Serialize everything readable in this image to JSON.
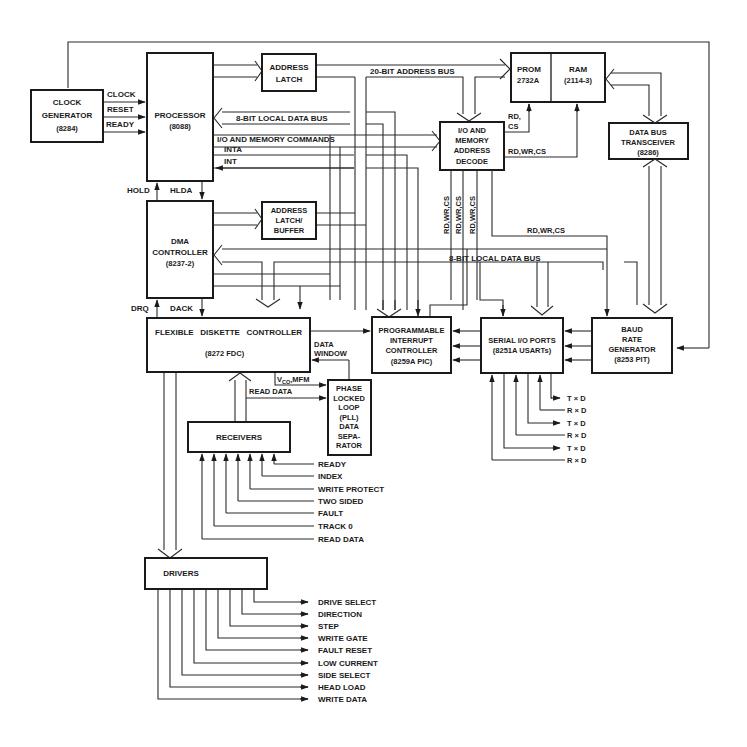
{
  "blocks": {
    "clock_generator": {
      "line1": "CLOCK",
      "line2": "GENERATOR",
      "line3": "(8284)"
    },
    "processor": {
      "line1": "PROCESSOR",
      "line2": "(8088)"
    },
    "address_latch": {
      "line1": "ADDRESS",
      "line2": "LATCH"
    },
    "prom": {
      "line1": "PROM",
      "line2": "2732A"
    },
    "ram": {
      "line1": "RAM",
      "line2": "(2114-3)"
    },
    "io_decode": {
      "line1": "I/O AND",
      "line2": "MEMORY",
      "line3": "ADDRESS",
      "line4": "DECODE"
    },
    "data_bus_transceiver": {
      "line1": "DATA BUS",
      "line2": "TRANSCEIVER",
      "line3": "(8286)"
    },
    "dma_controller": {
      "line1": "DMA",
      "line2": "CONTROLLER",
      "line3": "(8237-2)"
    },
    "address_latch_buffer": {
      "line1": "ADDRESS",
      "line2": "LATCH/",
      "line3": "BUFFER"
    },
    "fdc": {
      "line1": "FLEXIBLE   DISKETTE   CONTROLLER",
      "line2": "(8272 FDC)"
    },
    "pic": {
      "line1": "PROGRAMMABLE",
      "line2": "INTERRUPT",
      "line3": "CONTROLLER",
      "line4": "(8259A PIC)"
    },
    "serial_io": {
      "line1": "SERIAL I/O PORTS",
      "line2": "(8251A USARTs)"
    },
    "baud_rate": {
      "line1": "BAUD",
      "line2": "RATE",
      "line3": "GENERATOR",
      "line4": "(8253 PIT)"
    },
    "pll": {
      "line1": "PHASE",
      "line2": "LOCKED",
      "line3": "LOOP",
      "line4": "(PLL)",
      "line5": "DATA",
      "line6": "SEPA-",
      "line7": "RATOR"
    },
    "receivers": {
      "label": "RECEIVERS"
    },
    "drivers": {
      "label": "DRIVERS"
    }
  },
  "signals": {
    "clock": "CLOCK",
    "reset": "RESET",
    "ready": "READY",
    "hold": "HOLD",
    "hlda": "HLDA",
    "drq": "DRQ",
    "dack": "DACK",
    "address_bus_20": "20-BIT ADDRESS BUS",
    "local_data_bus_top": "8-BIT LOCAL DATA BUS",
    "local_data_bus_mid": "8-BIT  LOCAL  DATA  BUS",
    "io_mem_commands": "I/O AND MEMORY COMMANDS",
    "inta": "INTA",
    "int": "INT",
    "rd_cs_1": "RD,",
    "rd_cs_2": "CS",
    "rd_wr_cs": "RD,WR,CS",
    "rd_wr_cs_v1": "RD,WR,CS",
    "rd_wr_cs_v2": "RD,WR,CS",
    "rd_wr_cs_v3": "RD,WR,CS",
    "rd_wr_cs_mid": "RD,WR,CS",
    "data_window_1": "DATA",
    "data_window_2": "WINDOW",
    "vco_v": "V",
    "vco_sub": "CO",
    "vco_mfm": ",MFM",
    "read_data_pll": "READ DATA"
  },
  "serial_lines": [
    "T × D",
    "R × D",
    "T × D",
    "R × D",
    "T × D",
    "R × D"
  ],
  "receiver_inputs": [
    "READY",
    "INDEX",
    "WRITE PROTECT",
    "TWO SIDED",
    "FAULT",
    "TRACK 0",
    "READ DATA"
  ],
  "driver_outputs": [
    "DRIVE SELECT",
    "DIRECTION",
    "STEP",
    "WRITE GATE",
    "FAULT RESET",
    "LOW CURRENT",
    "SIDE SELECT",
    "HEAD LOAD",
    "WRITE DATA"
  ]
}
